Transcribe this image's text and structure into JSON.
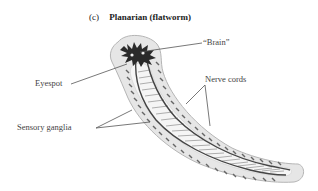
{
  "figure": {
    "part_label": "(c)",
    "title": "Planarian (flatworm)"
  },
  "labels": {
    "brain": "“Brain”",
    "eyespot": "Eyespot",
    "nerve_cords": "Nerve cords",
    "sensory_ganglia": "Sensory ganglia"
  },
  "colors": {
    "body_fill": "#e6e6e6",
    "body_outline": "#b5b5b5",
    "inner_fill": "#f4f4f4",
    "nerve": "#444444",
    "brain": "#2a2a2a",
    "leader_line": "#555555"
  }
}
